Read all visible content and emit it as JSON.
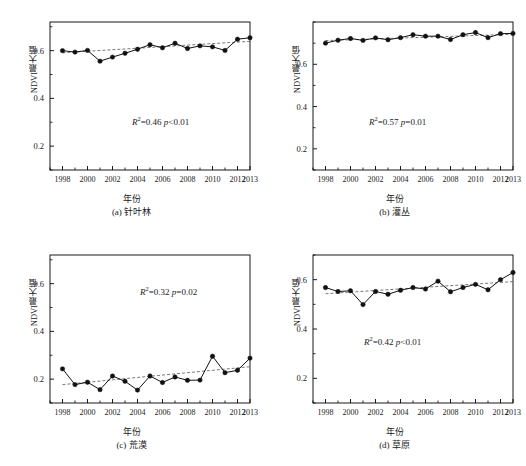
{
  "figure": {
    "axis_label_y": "NDVI最大值",
    "axis_label_x": "年份"
  },
  "chart_data": [
    {
      "type": "line",
      "panel": "a",
      "caption": "(a) 针叶林",
      "title": "",
      "xlabel": "年份",
      "ylabel": "NDVI最大值",
      "xlim": [
        1997,
        2013
      ],
      "ylim": [
        0.1,
        0.72
      ],
      "yticks": [
        0.2,
        0.4,
        0.6
      ],
      "ytick_labels": [
        "0.2",
        "0.4",
        "0.6"
      ],
      "xticks": [
        1998,
        2000,
        2002,
        2004,
        2006,
        2008,
        2010,
        2012,
        2013
      ],
      "xtick_labels": [
        "1998",
        "2000",
        "2002",
        "2004",
        "2006",
        "2008",
        "2010",
        "2012",
        "2013"
      ],
      "grid": false,
      "legend": "none",
      "x": [
        1998,
        1999,
        2000,
        2001,
        2002,
        2003,
        2004,
        2005,
        2006,
        2007,
        2008,
        2009,
        2010,
        2011,
        2012,
        2013
      ],
      "values": [
        0.6,
        0.594,
        0.601,
        0.556,
        0.573,
        0.589,
        0.606,
        0.625,
        0.612,
        0.631,
        0.609,
        0.62,
        0.616,
        0.601,
        0.648,
        0.654
      ],
      "annotation": "R²=0.46 p<0.01",
      "annotation_r2": "0.46",
      "annotation_p": "p<0.01",
      "trend": {
        "start_value": 0.591,
        "end_value": 0.639
      }
    },
    {
      "type": "line",
      "panel": "b",
      "caption": "(b) 灌丛",
      "title": "",
      "xlabel": "年份",
      "ylabel": "NDVI最大值",
      "xlim": [
        1997,
        2013
      ],
      "ylim": [
        0.1,
        0.8
      ],
      "yticks": [
        0.2,
        0.4,
        0.6
      ],
      "ytick_labels": [
        "0.2",
        "0.4",
        "0.6"
      ],
      "xticks": [
        1998,
        2000,
        2002,
        2004,
        2006,
        2008,
        2010,
        2012,
        2013
      ],
      "xtick_labels": [
        "1998",
        "2000",
        "2002",
        "2004",
        "2006",
        "2008",
        "2010",
        "2012",
        "2013"
      ],
      "grid": false,
      "legend": "none",
      "x": [
        1998,
        1999,
        2000,
        2001,
        2002,
        2003,
        2004,
        2005,
        2006,
        2007,
        2008,
        2009,
        2010,
        2011,
        2012,
        2013
      ],
      "values": [
        0.7,
        0.714,
        0.722,
        0.713,
        0.725,
        0.716,
        0.726,
        0.74,
        0.733,
        0.733,
        0.717,
        0.74,
        0.75,
        0.726,
        0.745,
        0.746
      ],
      "annotation": "R²=0.57 p=0.01",
      "annotation_r2": "0.57",
      "annotation_p": "p=0.01",
      "trend": {
        "start_value": 0.712,
        "end_value": 0.742
      }
    },
    {
      "type": "line",
      "panel": "c",
      "caption": "(c) 荒漠",
      "title": "",
      "xlabel": "年份",
      "ylabel": "NDVI最大值",
      "xlim": [
        1997,
        2013
      ],
      "ylim": [
        0.1,
        0.72
      ],
      "yticks": [
        0.2,
        0.4,
        0.6
      ],
      "ytick_labels": [
        "0.2",
        "0.4",
        "0.6"
      ],
      "xticks": [
        1998,
        2000,
        2002,
        2004,
        2006,
        2008,
        2010,
        2012,
        2013
      ],
      "xtick_labels": [
        "1998",
        "2000",
        "2002",
        "2004",
        "2006",
        "2008",
        "2010",
        "2012",
        "2013"
      ],
      "grid": false,
      "legend": "none",
      "x": [
        1998,
        1999,
        2000,
        2001,
        2002,
        2003,
        2004,
        2005,
        2006,
        2007,
        2008,
        2009,
        2010,
        2011,
        2012,
        2013
      ],
      "values": [
        0.243,
        0.177,
        0.187,
        0.156,
        0.213,
        0.191,
        0.154,
        0.213,
        0.186,
        0.209,
        0.195,
        0.196,
        0.296,
        0.227,
        0.237,
        0.288
      ],
      "annotation": "R²=0.32 p=0.02",
      "annotation_r2": "0.32",
      "annotation_p": "p=0.02",
      "trend": {
        "start_value": 0.177,
        "end_value": 0.252
      }
    },
    {
      "type": "line",
      "panel": "d",
      "caption": "(d) 草原",
      "title": "",
      "xlabel": "年份",
      "ylabel": "NDVI最大值",
      "xlim": [
        1997,
        2013
      ],
      "ylim": [
        0.1,
        0.7
      ],
      "yticks": [
        0.2,
        0.4,
        0.6
      ],
      "ytick_labels": [
        "0.2",
        "0.4",
        "0.6"
      ],
      "xticks": [
        1998,
        2000,
        2002,
        2004,
        2006,
        2008,
        2010,
        2012,
        2013
      ],
      "xtick_labels": [
        "1998",
        "2000",
        "2002",
        "2004",
        "2006",
        "2008",
        "2010",
        "2012",
        "2013"
      ],
      "grid": false,
      "legend": "none",
      "x": [
        1998,
        1999,
        2000,
        2001,
        2002,
        2003,
        2004,
        2005,
        2006,
        2007,
        2008,
        2009,
        2010,
        2011,
        2012,
        2013
      ],
      "values": [
        0.568,
        0.552,
        0.555,
        0.499,
        0.552,
        0.541,
        0.557,
        0.568,
        0.562,
        0.594,
        0.551,
        0.568,
        0.581,
        0.559,
        0.6,
        0.629
      ],
      "annotation": "R²=0.42 p<0.01",
      "annotation_r2": "0.42",
      "annotation_p": "p<0.01",
      "trend": {
        "start_value": 0.543,
        "end_value": 0.592
      }
    }
  ]
}
